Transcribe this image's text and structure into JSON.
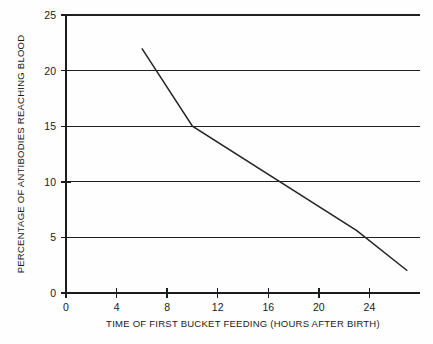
{
  "chart_data": {
    "type": "line",
    "title": "",
    "xlabel": "TIME OF FIRST BUCKET FEEDING (HOURS AFTER BIRTH)",
    "ylabel": "PERCENTAGE OF ANTIBODIES REACHING BLOOD",
    "xlim": [
      0,
      28
    ],
    "ylim": [
      0,
      25
    ],
    "grid": true,
    "legend": "none",
    "x_ticks": [
      0,
      4,
      8,
      12,
      16,
      20,
      24
    ],
    "x_tick_labels": [
      "0",
      "4",
      "8",
      "12",
      "16",
      "20",
      "24"
    ],
    "y_ticks": [
      0,
      5,
      10,
      15,
      20,
      25
    ],
    "y_tick_labels": [
      "0",
      "5",
      "10",
      "15",
      "20",
      "25"
    ],
    "gridlines_y": [
      5,
      10,
      15,
      20,
      25
    ],
    "series": [
      {
        "name": "Percentage of antibodies reaching blood",
        "x": [
          6,
          10,
          23,
          27
        ],
        "values": [
          22,
          15,
          5.6,
          2
        ]
      }
    ],
    "colors": {
      "line": "#242424",
      "axis": "#1c1c1c",
      "grid": "#202020",
      "background": "#fefefe",
      "text": "#1a1a1a"
    }
  }
}
